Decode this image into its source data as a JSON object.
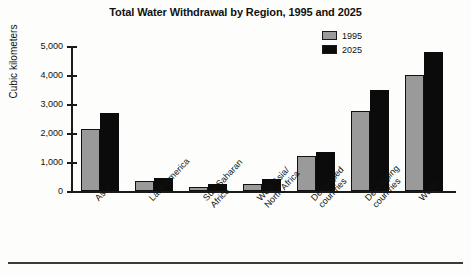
{
  "chart_data": {
    "type": "bar",
    "title": "Total Water Withdrawal by Region, 1995 and 2025",
    "xlabel": "",
    "ylabel": "Cubic kilometers",
    "ylim": [
      0,
      5000
    ],
    "yticks": [
      "0",
      "1,000",
      "2,000",
      "3,000",
      "4,000",
      "5,000"
    ],
    "ytick_values": [
      0,
      1000,
      2000,
      3000,
      4000,
      5000
    ],
    "grid": false,
    "legend_position": "top-right",
    "categories": [
      "Asia",
      "Latin America",
      "Sub-Saharan Africa",
      "West Asia/ North Africa",
      "Developed countries",
      "Developing countries",
      "World"
    ],
    "category_lines": [
      [
        "Asia"
      ],
      [
        "Latin America"
      ],
      [
        "Sub-Saharan",
        "Africa"
      ],
      [
        "West Asia/",
        "North Africa"
      ],
      [
        "Developed",
        "countries"
      ],
      [
        "Developing",
        "countries"
      ],
      [
        "World"
      ]
    ],
    "series": [
      {
        "name": "1995",
        "color": "#9a9a9a",
        "values": [
          2150,
          350,
          150,
          230,
          1200,
          2750,
          4000
        ]
      },
      {
        "name": "2025",
        "color": "#0b0b0b",
        "values": [
          2700,
          450,
          250,
          400,
          1350,
          3500,
          4800
        ]
      }
    ]
  },
  "legend": {
    "items": [
      {
        "label": "1995"
      },
      {
        "label": "2025"
      }
    ]
  }
}
